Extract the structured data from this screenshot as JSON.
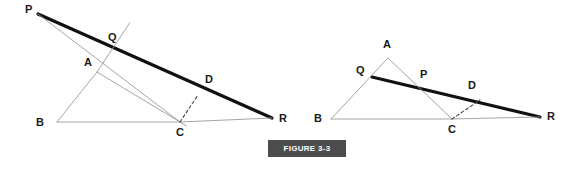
{
  "figure": {
    "badge_label": "FIGURE 3-3",
    "badge_bg": "#4d4d4d",
    "badge_text_color": "#ffffff",
    "badge_box": {
      "x": 268,
      "y": 140,
      "w": 78,
      "h": 17
    }
  },
  "style": {
    "thick_line_color": "#111111",
    "thick_line_width": 3.2,
    "thin_line_color": "#9a9a9a",
    "thin_line_width": 0.9,
    "dash_line_color": "#4a4a4a",
    "dash_pattern": "3,2.5",
    "label_color": "#1a1a1a",
    "background": "#ffffff"
  },
  "chart_data": {
    "type": "diagram",
    "title": "FIGURE 3-3",
    "diagrams": [
      {
        "name": "left-diagram",
        "points": {
          "P": {
            "x": 38,
            "y": 14,
            "label": "P",
            "label_x": 25,
            "label_y": 13
          },
          "Q": {
            "x": 113,
            "y": 48,
            "label": "Q",
            "label_x": 108,
            "label_y": 41
          },
          "A": {
            "x": 97,
            "y": 72,
            "label": "A",
            "label_x": 84,
            "label_y": 66
          },
          "B": {
            "x": 57,
            "y": 122,
            "label": "B",
            "label_x": 36,
            "label_y": 126
          },
          "C": {
            "x": 180,
            "y": 122,
            "label": "C",
            "label_x": 176,
            "label_y": 136
          },
          "D": {
            "x": 198,
            "y": 95,
            "label": "D",
            "label_x": 205,
            "label_y": 83
          },
          "R": {
            "x": 272,
            "y": 118,
            "label": "R",
            "label_x": 279,
            "label_y": 122
          }
        },
        "segments": [
          {
            "name": "thick-line-PR",
            "from": "P",
            "to": "R",
            "weight": "thick"
          },
          {
            "name": "triangle-side-AB",
            "from": "A",
            "to": "B",
            "weight": "thin"
          },
          {
            "name": "triangle-side-BC",
            "from": "B",
            "to": "C",
            "weight": "thin"
          },
          {
            "name": "base-line-CR",
            "from": "C",
            "to": "R",
            "weight": "thin"
          },
          {
            "name": "segment-PC",
            "from": "P",
            "to": "C",
            "weight": "thin"
          },
          {
            "name": "segment-AQ-extended",
            "from": "A",
            "to": "Q",
            "weight": "thin"
          },
          {
            "name": "segment-A-down",
            "from": "A",
            "to": "C",
            "weight": "thin"
          },
          {
            "name": "perpendicular-CD",
            "from": "C",
            "to": "D",
            "weight": "dashed"
          }
        ]
      },
      {
        "name": "right-diagram",
        "points": {
          "A": {
            "x": 388,
            "y": 58,
            "label": "A",
            "label_x": 383,
            "label_y": 48
          },
          "Q": {
            "x": 372,
            "y": 77,
            "label": "Q",
            "label_x": 356,
            "label_y": 74
          },
          "P": {
            "x": 423,
            "y": 88,
            "label": "P",
            "label_x": 420,
            "label_y": 78
          },
          "B": {
            "x": 331,
            "y": 119,
            "label": "B",
            "label_x": 314,
            "label_y": 122
          },
          "C": {
            "x": 452,
            "y": 119,
            "label": "C",
            "label_x": 448,
            "label_y": 133
          },
          "D": {
            "x": 480,
            "y": 100,
            "label": "D",
            "label_x": 468,
            "label_y": 89
          },
          "R": {
            "x": 540,
            "y": 117,
            "label": "R",
            "label_x": 547,
            "label_y": 120
          }
        },
        "segments": [
          {
            "name": "thick-line-QR",
            "from": "Q",
            "to": "R",
            "weight": "thick"
          },
          {
            "name": "triangle-side-AB",
            "from": "A",
            "to": "B",
            "weight": "thin"
          },
          {
            "name": "triangle-side-BC",
            "from": "B",
            "to": "C",
            "weight": "thin"
          },
          {
            "name": "base-line-CR",
            "from": "C",
            "to": "R",
            "weight": "thin"
          },
          {
            "name": "triangle-side-AC",
            "from": "A",
            "to": "C",
            "weight": "thin"
          },
          {
            "name": "perpendicular-CD",
            "from": "C",
            "to": "D",
            "weight": "dashed"
          }
        ]
      }
    ]
  }
}
